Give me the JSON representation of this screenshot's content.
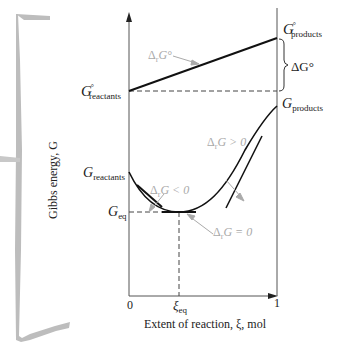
{
  "figure": {
    "y_axis_label": "Gibbs energy, G",
    "x_axis_label": "Extent of reaction, ξ, mol",
    "x_ticks": [
      "0",
      "ξeq",
      "1"
    ],
    "left_labels": {
      "g_std_reactants": {
        "main": "G",
        "sup": "°",
        "sub": "reactants"
      },
      "g_reactants": {
        "main": "G",
        "sub": "reactants"
      },
      "g_eq": {
        "main": "G",
        "sub": "eq"
      }
    },
    "right_labels": {
      "g_std_products": {
        "main": "G",
        "sup": "°",
        "sub": "products"
      },
      "g_products": {
        "main": "G",
        "sub": "products"
      },
      "delta_g_std": "ΔG°"
    },
    "annotations": {
      "standard_slope": {
        "delta": "Δ",
        "sub": "r",
        "text": "G°"
      },
      "negative": {
        "delta": "Δ",
        "sub": "r",
        "text": "G < 0"
      },
      "zero": {
        "delta": "Δ",
        "sub": "r",
        "text": "G = 0"
      },
      "positive": {
        "delta": "Δ",
        "sub": "r",
        "text": "G > 0"
      }
    },
    "xi_eq_sub": "eq",
    "xi_symbol": "ξ",
    "colors": {
      "axis": "#555555",
      "curve": "#111111",
      "annotation": "#a9a9a9",
      "bracket": "#bdbdbd"
    }
  }
}
